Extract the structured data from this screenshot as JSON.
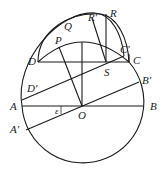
{
  "diagram": {
    "points": {
      "O": {
        "label": "O",
        "x": 82,
        "y": 106
      },
      "A": {
        "label": "A",
        "x": 22,
        "y": 106
      },
      "B": {
        "label": "B",
        "x": 143,
        "y": 106
      },
      "A_prime": {
        "label": "A′",
        "x": 26,
        "y": 130
      },
      "B_prime": {
        "label": "B′",
        "x": 139,
        "y": 82
      },
      "D": {
        "label": "D",
        "x": 38,
        "y": 62
      },
      "C": {
        "label": "C",
        "x": 129,
        "y": 62
      },
      "D_prime": {
        "label": "D′",
        "x": 22,
        "y": 96
      },
      "C_prime": {
        "label": "C′",
        "x": 124,
        "y": 56
      },
      "P": {
        "label": "P",
        "x": 58,
        "y": 48
      },
      "Q": {
        "label": "Q",
        "x": 82,
        "y": 42
      },
      "S": {
        "label": "S",
        "x": 106,
        "y": 62
      },
      "R": {
        "label": "R",
        "x": 107,
        "y": 18
      },
      "R_prime": {
        "label": "R′",
        "x": 95,
        "y": 20
      }
    },
    "angle_label": "ε",
    "stroke_color": "#1a1a1a"
  }
}
